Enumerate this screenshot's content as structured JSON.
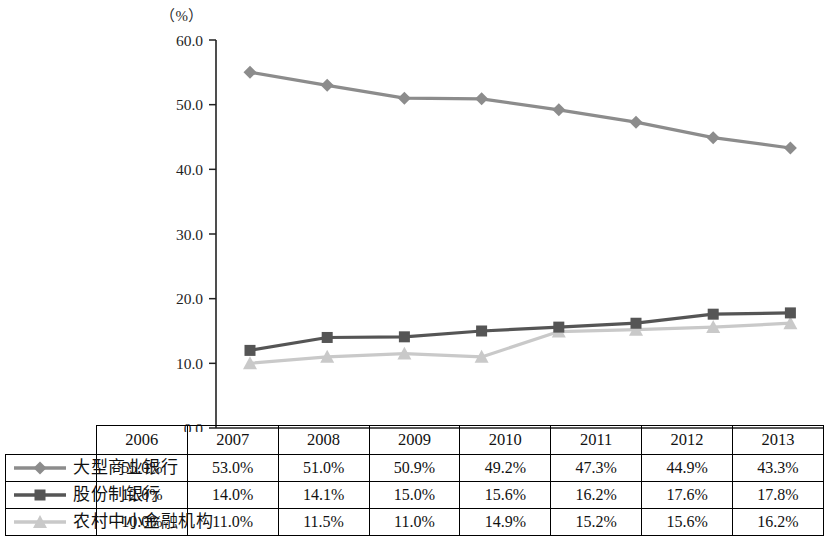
{
  "chart_data": {
    "type": "line",
    "title": "",
    "subtitle": "",
    "unit_label": "（%）",
    "xlabel": "",
    "ylabel": "",
    "ylim": [
      0,
      60
    ],
    "ytick_labels": [
      "0.0",
      "10.0",
      "20.0",
      "30.0",
      "40.0",
      "50.0",
      "60.0"
    ],
    "ytick_values": [
      0,
      10,
      20,
      30,
      40,
      50,
      60
    ],
    "grid": false,
    "legend_position": "table-left-column",
    "categories": [
      "2006",
      "2007",
      "2008",
      "2009",
      "2010",
      "2011",
      "2012",
      "2013"
    ],
    "series": [
      {
        "name": "大型商业银行",
        "marker": "diamond",
        "color": "#8c8c8c",
        "values": [
          55.0,
          53.0,
          51.0,
          50.9,
          49.2,
          47.3,
          44.9,
          43.3
        ],
        "labels": [
          "55.0%",
          "53.0%",
          "51.0%",
          "50.9%",
          "49.2%",
          "47.3%",
          "44.9%",
          "43.3%"
        ]
      },
      {
        "name": "股份制银行",
        "marker": "square",
        "color": "#555555",
        "values": [
          12.0,
          14.0,
          14.1,
          15.0,
          15.6,
          16.2,
          17.6,
          17.8
        ],
        "labels": [
          "12.0%",
          "14.0%",
          "14.1%",
          "15.0%",
          "15.6%",
          "16.2%",
          "17.6%",
          "17.8%"
        ]
      },
      {
        "name": "农村中小金融机构",
        "marker": "triangle",
        "color": "#c9c9c9",
        "values": [
          10.0,
          11.0,
          11.5,
          11.0,
          14.9,
          15.2,
          15.6,
          16.2
        ],
        "labels": [
          "10.0%",
          "11.0%",
          "11.5%",
          "11.0%",
          "14.9%",
          "15.2%",
          "15.6%",
          "16.2%"
        ]
      }
    ]
  },
  "table": {
    "corner": "",
    "year_headers": [
      "2006",
      "2007",
      "2008",
      "2009",
      "2010",
      "2011",
      "2012",
      "2013"
    ],
    "rows": [
      {
        "legend": "大型商业银行",
        "marker": "diamond",
        "color": "#8c8c8c",
        "cells": [
          "55.0%",
          "53.0%",
          "51.0%",
          "50.9%",
          "49.2%",
          "47.3%",
          "44.9%",
          "43.3%"
        ]
      },
      {
        "legend": "股份制银行",
        "marker": "square",
        "color": "#555555",
        "cells": [
          "12.0%",
          "14.0%",
          "14.1%",
          "15.0%",
          "15.6%",
          "16.2%",
          "17.6%",
          "17.8%"
        ]
      },
      {
        "legend": "农村中小金融机构",
        "marker": "triangle",
        "color": "#c9c9c9",
        "cells": [
          "10.0%",
          "11.0%",
          "11.5%",
          "11.0%",
          "14.9%",
          "15.2%",
          "15.6%",
          "16.2%"
        ]
      }
    ]
  }
}
